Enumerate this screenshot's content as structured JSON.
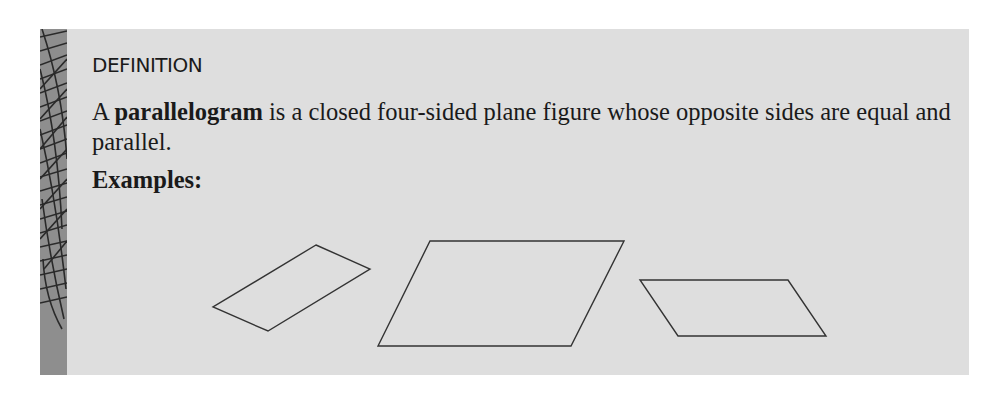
{
  "definition": {
    "heading": "DEFINITION",
    "text_prefix": "A ",
    "term": "parallelogram",
    "text_suffix": " is a closed four-sided plane figure whose opposite sides are equal and parallel.",
    "examples_label": "Examples:"
  },
  "colors": {
    "box_background": "#dedede",
    "stripe": "#8e8e8e",
    "text": "#1a1a1a"
  },
  "figures": [
    {
      "name": "parallelogram-1",
      "points": "316,245 370,269 268,331 213,307"
    },
    {
      "name": "parallelogram-2",
      "points": "430,241 624,241 571,346 378,346"
    },
    {
      "name": "parallelogram-3",
      "points": "640,280 788,280 826,336 678,336"
    }
  ]
}
